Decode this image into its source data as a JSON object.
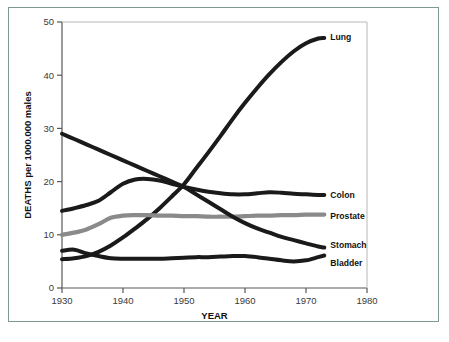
{
  "figure": {
    "frame_color": "#7e9b91",
    "background": "#ffffff"
  },
  "axes": {
    "x_title": "YEAR",
    "y_title": "DEATHS per 1000.000 males",
    "x_ticks": [
      "1930",
      "1940",
      "1950",
      "1960",
      "1970",
      "1980"
    ],
    "y_ticks": [
      "0",
      "10",
      "20",
      "30",
      "40",
      "50"
    ]
  },
  "labels": {
    "lung": "Lung",
    "colon": "Colon",
    "prostate": "Prostate",
    "stomach": "Stomach",
    "bladder": "Bladder"
  },
  "chart_data": {
    "type": "line",
    "title": "",
    "xlabel": "YEAR",
    "ylabel": "DEATHS per 1000.000 males",
    "xlim": [
      1930,
      1980
    ],
    "ylim": [
      0,
      50
    ],
    "xticks": [
      1930,
      1940,
      1950,
      1960,
      1970,
      1980
    ],
    "yticks": [
      0,
      10,
      20,
      30,
      40,
      50
    ],
    "grid": false,
    "legend": "inline-right-end-labels",
    "x": [
      1930,
      1932,
      1934,
      1936,
      1938,
      1940,
      1942,
      1944,
      1946,
      1948,
      1950,
      1952,
      1954,
      1956,
      1958,
      1960,
      1962,
      1964,
      1966,
      1968,
      1970,
      1972,
      1973
    ],
    "series": [
      {
        "name": "Lung",
        "color": "#1a1a1a",
        "values": [
          5.4,
          5.6,
          6.0,
          6.8,
          8.0,
          9.5,
          11.2,
          13.0,
          15.0,
          17.2,
          19.5,
          22.5,
          25.5,
          28.6,
          31.8,
          34.8,
          37.6,
          40.2,
          42.5,
          44.5,
          46.0,
          46.9,
          47.0
        ]
      },
      {
        "name": "Colon",
        "color": "#1a1a1a",
        "values": [
          14.5,
          15.0,
          15.6,
          16.4,
          18.0,
          19.6,
          20.4,
          20.5,
          20.2,
          19.6,
          19.0,
          18.5,
          18.1,
          17.8,
          17.6,
          17.6,
          17.8,
          18.0,
          17.9,
          17.7,
          17.6,
          17.5,
          17.5
        ]
      },
      {
        "name": "Prostate",
        "color": "#8a8a8a",
        "values": [
          10.0,
          10.4,
          11.0,
          12.0,
          13.2,
          13.6,
          13.7,
          13.7,
          13.6,
          13.6,
          13.5,
          13.5,
          13.4,
          13.4,
          13.4,
          13.5,
          13.6,
          13.6,
          13.7,
          13.7,
          13.8,
          13.8,
          13.8
        ]
      },
      {
        "name": "Stomach",
        "color": "#1a1a1a",
        "values": [
          29.0,
          28.0,
          27.0,
          26.0,
          25.0,
          24.0,
          23.0,
          22.0,
          21.0,
          20.0,
          19.0,
          17.6,
          16.2,
          14.8,
          13.4,
          12.2,
          11.2,
          10.4,
          9.6,
          9.0,
          8.4,
          7.8,
          7.6
        ]
      },
      {
        "name": "Bladder",
        "color": "#1a1a1a",
        "values": [
          7.0,
          7.2,
          6.5,
          6.0,
          5.6,
          5.5,
          5.5,
          5.5,
          5.5,
          5.6,
          5.7,
          5.8,
          5.8,
          5.9,
          6.0,
          6.0,
          5.8,
          5.5,
          5.2,
          5.0,
          5.2,
          5.8,
          6.1
        ]
      }
    ]
  }
}
